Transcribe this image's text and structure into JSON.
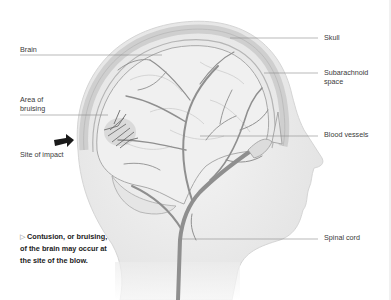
{
  "diagram": {
    "labels_left": [
      {
        "id": "brain",
        "text": "Brain"
      },
      {
        "id": "area-of-bruising",
        "line1": "Area of",
        "line2": "bruising"
      },
      {
        "id": "site-of-impact",
        "text": "Site of impact"
      }
    ],
    "labels_right": [
      {
        "id": "skull",
        "text": "Skull"
      },
      {
        "id": "subarachnoid-space",
        "line1": "Subarachnoid",
        "line2": "space"
      },
      {
        "id": "blood-vessels",
        "text": "Blood vessels"
      },
      {
        "id": "spinal-cord",
        "text": "Spinal cord"
      }
    ],
    "caption": {
      "marker": "▷",
      "text": "Contusion, or bruising, of the brain may occur at the site of the blow."
    },
    "colors": {
      "leader_line": "#8a8a8a",
      "arrow": "#1a1a1a",
      "skull_fill": "#e6e6e6",
      "brain_fill": "#efefef",
      "vessel": "#8f8f8f",
      "bruise": "#555555"
    }
  }
}
